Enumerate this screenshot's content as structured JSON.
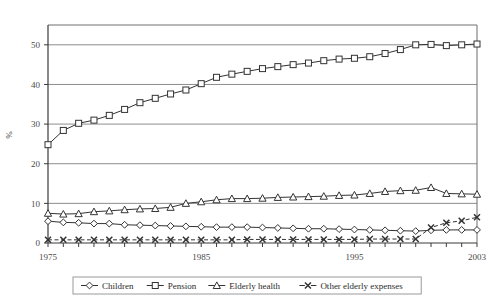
{
  "chart_data": {
    "type": "line",
    "title": "",
    "xlabel": "",
    "ylabel": "%",
    "xlim": [
      1975,
      2003
    ],
    "ylim": [
      0,
      55
    ],
    "yticks": [
      0,
      10,
      20,
      30,
      40,
      50
    ],
    "ytick_labels": [
      "0",
      "10",
      "20",
      "30",
      "40",
      "50"
    ],
    "xticks": [
      1975,
      1985,
      1995,
      2003
    ],
    "xtick_labels": [
      "1975",
      "1985",
      "1995",
      "2003"
    ],
    "grid": "horizontal",
    "legend_position": "bottom-center",
    "x": [
      1975,
      1976,
      1977,
      1978,
      1979,
      1980,
      1981,
      1982,
      1983,
      1984,
      1985,
      1986,
      1987,
      1988,
      1989,
      1990,
      1991,
      1992,
      1993,
      1994,
      1995,
      1996,
      1997,
      1998,
      1999,
      2000,
      2001,
      2002,
      2003
    ],
    "series": [
      {
        "name": "Children",
        "marker": "diamond",
        "color": "#333333",
        "values": [
          5.5,
          5.2,
          5.1,
          4.9,
          4.9,
          4.6,
          4.5,
          4.4,
          4.3,
          4.2,
          4.1,
          4.0,
          4.0,
          4.0,
          3.9,
          3.8,
          3.7,
          3.6,
          3.6,
          3.5,
          3.4,
          3.3,
          3.2,
          3.1,
          3.0,
          3.2,
          3.3,
          3.3,
          3.3
        ]
      },
      {
        "name": "Pension",
        "marker": "square",
        "color": "#333333",
        "values": [
          24.8,
          28.4,
          30.2,
          31.0,
          32.2,
          33.7,
          35.4,
          36.5,
          37.6,
          38.6,
          40.2,
          41.8,
          42.6,
          43.3,
          44.0,
          44.5,
          45.0,
          45.4,
          46.0,
          46.4,
          46.6,
          47.0,
          47.8,
          48.8,
          50.0,
          50.1,
          49.8,
          50.0,
          50.2
        ]
      },
      {
        "name": "Elderly health",
        "marker": "triangle",
        "color": "#333333",
        "values": [
          7.5,
          7.3,
          7.4,
          7.9,
          8.1,
          8.4,
          8.6,
          8.7,
          9.0,
          10.0,
          10.4,
          10.9,
          11.2,
          11.2,
          11.3,
          11.5,
          11.6,
          11.7,
          11.8,
          12.0,
          12.1,
          12.5,
          13.0,
          13.2,
          13.3,
          14.0,
          12.5,
          12.4,
          12.3
        ]
      },
      {
        "name": "Other elderly expenses",
        "marker": "cross",
        "color": "#333333",
        "values": [
          0.8,
          0.8,
          0.8,
          0.8,
          0.8,
          0.8,
          0.8,
          0.8,
          0.8,
          0.8,
          0.8,
          0.8,
          0.8,
          0.9,
          0.9,
          0.9,
          0.9,
          0.9,
          0.9,
          0.9,
          0.9,
          1.0,
          1.0,
          1.0,
          1.0,
          3.9,
          5.1,
          5.6,
          6.5
        ]
      }
    ]
  }
}
